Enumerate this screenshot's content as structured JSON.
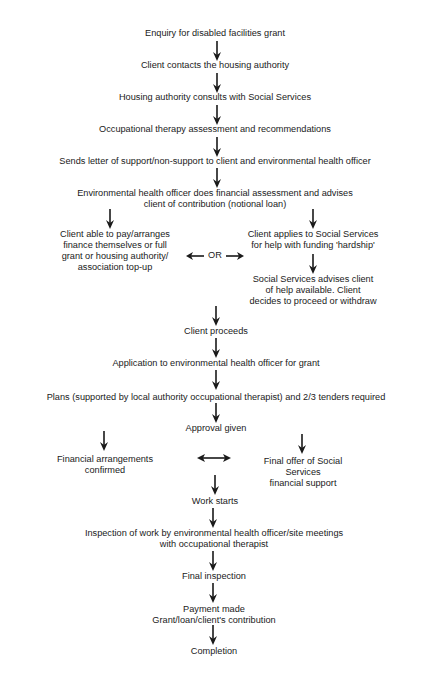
{
  "diagram": {
    "type": "flowchart",
    "steps": {
      "enquiry": "Enquiry for disabled facilities grant",
      "contact": "Client contacts the housing authority",
      "consult": "Housing authority consults with Social Services",
      "ot_assessment": "Occupational therapy assessment and recommendations",
      "letter": "Sends letter of support/non-support to client and environmental health officer",
      "ehoassess_l1": "Environmental health officer does financial assessment and advises",
      "ehoassess_l2": "client of contribution (notional loan)",
      "left_l1": "Client able to pay/arranges",
      "left_l2": "finance themselves or full",
      "left_l3": "grant or housing authority/",
      "left_l4": "association top-up",
      "or": "OR",
      "right_l1": "Client applies to Social Services",
      "right_l2": "for help with funding 'hardship'",
      "ss_l1": "Social Services advises client",
      "ss_l2": "of help available. Client",
      "ss_l3": "decides to proceed or withdraw",
      "proceeds": "Client proceeds",
      "application": "Application to environmental health officer for grant",
      "plans": "Plans (supported by local authority occupational therapist) and 2/3 tenders required",
      "approval": "Approval given",
      "fin_l1": "Financial arrangements",
      "fin_l2": "confirmed",
      "offer_l1": "Final offer of Social",
      "offer_l2": "Services",
      "offer_l3": "financial support",
      "work": "Work starts",
      "inspect_l1": "Inspection of work by environmental health officer/site meetings",
      "inspect_l2": "with occupational therapist",
      "final_inspection": "Final inspection",
      "payment_l1": "Payment made",
      "payment_l2": "Grant/loan/client's contribution",
      "completion": "Completion"
    },
    "colors": {
      "ink": "#1a1a1a",
      "background": "#ffffff"
    }
  }
}
